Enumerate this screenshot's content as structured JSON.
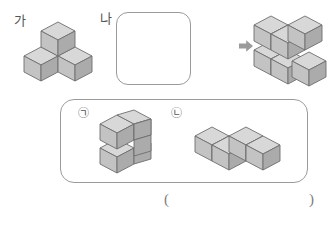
{
  "page": {
    "background": "#ffffff",
    "width": 333,
    "height": 225
  },
  "labels": {
    "ga": "가",
    "na": "나",
    "option_a": "㉠",
    "option_b": "㉡",
    "paren_open": "(",
    "paren_close": ")"
  },
  "colors": {
    "cube_top": "#d8d8d8",
    "cube_left": "#c3c3c3",
    "cube_right": "#ababab",
    "cube_stroke": "#6e6e6e",
    "box_stroke": "#9a9a9a",
    "arrow_fill": "#9b9b9b",
    "text": "#555555"
  },
  "shapes": {
    "ga": {
      "name": "three-cube-tripod",
      "cube_count": 3,
      "description": "가 모양: 세 개의 쌓기나무",
      "cubes": [
        {
          "x": 0,
          "y": 0,
          "z": 1
        },
        {
          "x": 0,
          "y": 1,
          "z": 0
        },
        {
          "x": 1,
          "y": 0,
          "z": 0
        }
      ]
    },
    "na": {
      "name": "empty-box",
      "cube_count": 0,
      "description": "나 모양: 빈 상자"
    },
    "result": {
      "name": "six-cube-result",
      "cube_count": 6,
      "description": "완성된 모양",
      "cubes": [
        {
          "x": 0,
          "y": 0,
          "z": 0
        },
        {
          "x": 1,
          "y": 0,
          "z": 0
        },
        {
          "x": 0,
          "y": 1,
          "z": 0
        },
        {
          "x": 2,
          "y": 0,
          "z": 0
        },
        {
          "x": 0,
          "y": 0,
          "z": 1
        },
        {
          "x": 1,
          "y": 0,
          "z": 1
        }
      ]
    },
    "option_a": {
      "name": "two-by-two-wall",
      "cube_count": 4,
      "description": "㉠ 모양: 2층 2줄 벽",
      "cubes": [
        {
          "x": 0,
          "y": 0,
          "z": 0
        },
        {
          "x": 0,
          "y": 1,
          "z": 0
        },
        {
          "x": 0,
          "y": 0,
          "z": 1
        },
        {
          "x": 0,
          "y": 1,
          "z": 1
        }
      ]
    },
    "option_b": {
      "name": "l-shaped-four-cube",
      "cube_count": 4,
      "description": "㉡ 모양: ㄴ자 모양 네 개",
      "cubes": [
        {
          "x": 0,
          "y": 0,
          "z": 0
        },
        {
          "x": 1,
          "y": 0,
          "z": 0
        },
        {
          "x": 2,
          "y": 0,
          "z": 0
        },
        {
          "x": 2,
          "y": 1,
          "z": 0
        }
      ]
    }
  },
  "icons": {
    "arrow": "right-arrow-icon"
  }
}
